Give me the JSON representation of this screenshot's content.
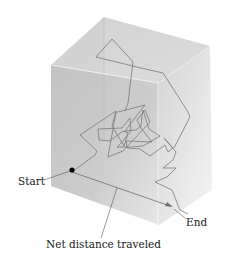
{
  "figure": {
    "type": "random-walk-diffusion-diagram",
    "labels": {
      "start": "Start",
      "end": "End",
      "net_distance": "Net distance traveled"
    },
    "colors": {
      "box_front": "#c8c8c8",
      "box_top": "#d6d6d6",
      "box_side": "#e2e2e2",
      "path": "#7a7a7a",
      "arrow": "#6e6e6e",
      "start_dot": "#000000",
      "leader_line": "#555555"
    }
  }
}
